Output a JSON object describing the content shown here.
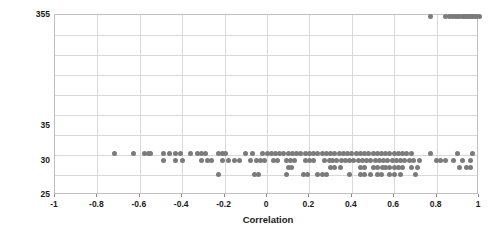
{
  "chart_data": {
    "type": "scatter",
    "title": "",
    "xlabel": "Correlation",
    "ylabel": "Number of elements",
    "xlim": [
      -1,
      1
    ],
    "xticks": [
      -1,
      -0.8,
      -0.6,
      -0.4,
      -0.2,
      0,
      0.2,
      0.4,
      0.6,
      0.8,
      1
    ],
    "xtick_labels": [
      "-1",
      "-0.8",
      "-0.6",
      "-0.4",
      "-0.2",
      "0",
      "0.2",
      "0.4",
      "0.6",
      "0.8",
      "1"
    ],
    "yticks": [
      25,
      30,
      35,
      355
    ],
    "ytick_labels": [
      "25",
      "30",
      "35",
      "355"
    ],
    "y_axis_note": "non-linear / broken axis: 25, 30, 35 then jump to 355",
    "grid": true,
    "grid_color": "#d9d9d9",
    "marker_color": "#7b7b7b",
    "marker_shape": "circle",
    "legend": false,
    "series": [
      {
        "name": "elements vs correlation",
        "points": [
          [
            -0.72,
            31
          ],
          [
            -0.63,
            31
          ],
          [
            -0.58,
            31
          ],
          [
            -0.56,
            31
          ],
          [
            -0.55,
            31
          ],
          [
            -0.49,
            31
          ],
          [
            -0.46,
            31
          ],
          [
            -0.43,
            31
          ],
          [
            -0.41,
            31
          ],
          [
            -0.36,
            31
          ],
          [
            -0.33,
            31
          ],
          [
            -0.31,
            31
          ],
          [
            -0.29,
            31
          ],
          [
            -0.23,
            31
          ],
          [
            -0.21,
            31
          ],
          [
            -0.195,
            31
          ],
          [
            -0.1,
            31
          ],
          [
            -0.07,
            31
          ],
          [
            -0.02,
            31
          ],
          [
            0.0,
            31
          ],
          [
            0.02,
            31
          ],
          [
            0.04,
            31
          ],
          [
            0.06,
            31
          ],
          [
            0.08,
            31
          ],
          [
            0.1,
            31
          ],
          [
            0.12,
            31
          ],
          [
            0.14,
            31
          ],
          [
            0.16,
            31
          ],
          [
            0.18,
            31
          ],
          [
            0.2,
            31
          ],
          [
            0.22,
            31
          ],
          [
            0.24,
            31
          ],
          [
            0.26,
            31
          ],
          [
            0.28,
            31
          ],
          [
            0.3,
            31
          ],
          [
            0.32,
            31
          ],
          [
            0.34,
            31
          ],
          [
            0.36,
            31
          ],
          [
            0.38,
            31
          ],
          [
            0.4,
            31
          ],
          [
            0.42,
            31
          ],
          [
            0.44,
            31
          ],
          [
            0.46,
            31
          ],
          [
            0.48,
            31
          ],
          [
            0.5,
            31
          ],
          [
            0.52,
            31
          ],
          [
            0.54,
            31
          ],
          [
            0.56,
            31
          ],
          [
            0.58,
            31
          ],
          [
            0.6,
            31
          ],
          [
            0.62,
            31
          ],
          [
            0.64,
            31
          ],
          [
            0.66,
            31
          ],
          [
            0.68,
            31
          ],
          [
            0.77,
            31
          ],
          [
            0.9,
            31
          ],
          [
            0.97,
            31
          ],
          [
            -0.49,
            30
          ],
          [
            -0.43,
            30
          ],
          [
            -0.4,
            30
          ],
          [
            -0.31,
            30
          ],
          [
            -0.28,
            30
          ],
          [
            -0.26,
            30
          ],
          [
            -0.21,
            30
          ],
          [
            -0.18,
            30
          ],
          [
            -0.155,
            30
          ],
          [
            -0.13,
            30
          ],
          [
            -0.08,
            30
          ],
          [
            -0.05,
            30
          ],
          [
            -0.03,
            30
          ],
          [
            -0.01,
            30
          ],
          [
            0.03,
            30
          ],
          [
            0.05,
            30
          ],
          [
            0.09,
            30
          ],
          [
            0.11,
            30
          ],
          [
            0.13,
            30
          ],
          [
            0.18,
            30
          ],
          [
            0.2,
            30
          ],
          [
            0.22,
            30
          ],
          [
            0.27,
            30
          ],
          [
            0.295,
            30
          ],
          [
            0.31,
            30
          ],
          [
            0.33,
            30
          ],
          [
            0.35,
            30
          ],
          [
            0.37,
            30
          ],
          [
            0.39,
            30
          ],
          [
            0.41,
            30
          ],
          [
            0.43,
            30
          ],
          [
            0.45,
            30
          ],
          [
            0.47,
            30
          ],
          [
            0.49,
            30
          ],
          [
            0.51,
            30
          ],
          [
            0.53,
            30
          ],
          [
            0.55,
            30
          ],
          [
            0.57,
            30
          ],
          [
            0.59,
            30
          ],
          [
            0.61,
            30
          ],
          [
            0.63,
            30
          ],
          [
            0.65,
            30
          ],
          [
            0.67,
            30
          ],
          [
            0.69,
            30
          ],
          [
            0.72,
            30
          ],
          [
            0.8,
            30
          ],
          [
            0.82,
            30
          ],
          [
            0.84,
            30
          ],
          [
            0.88,
            30
          ],
          [
            0.92,
            30
          ],
          [
            0.96,
            30
          ],
          [
            0.1,
            29
          ],
          [
            0.115,
            29
          ],
          [
            0.3,
            29
          ],
          [
            0.32,
            29
          ],
          [
            0.345,
            29
          ],
          [
            0.44,
            29
          ],
          [
            0.46,
            29
          ],
          [
            0.5,
            29
          ],
          [
            0.52,
            29
          ],
          [
            0.545,
            29
          ],
          [
            0.56,
            29
          ],
          [
            0.58,
            29
          ],
          [
            0.6,
            29
          ],
          [
            0.62,
            29
          ],
          [
            0.64,
            29
          ],
          [
            0.68,
            29
          ],
          [
            0.71,
            29
          ],
          [
            0.91,
            29
          ],
          [
            0.94,
            29
          ],
          [
            0.96,
            29
          ],
          [
            -0.23,
            28
          ],
          [
            -0.06,
            28
          ],
          [
            -0.04,
            28
          ],
          [
            0.09,
            28
          ],
          [
            0.17,
            28
          ],
          [
            0.19,
            28
          ],
          [
            0.24,
            28
          ],
          [
            0.26,
            28
          ],
          [
            0.28,
            28
          ],
          [
            0.39,
            28
          ],
          [
            0.44,
            28
          ],
          [
            0.46,
            28
          ],
          [
            0.49,
            28
          ],
          [
            0.52,
            28
          ],
          [
            0.54,
            28
          ],
          [
            0.58,
            28
          ],
          [
            0.6,
            28
          ],
          [
            0.63,
            28
          ],
          [
            0.7,
            28
          ],
          [
            0.77,
            352
          ],
          [
            0.84,
            352
          ],
          [
            0.86,
            352
          ],
          [
            0.875,
            352
          ],
          [
            0.89,
            352
          ],
          [
            0.9,
            352
          ],
          [
            0.91,
            352
          ],
          [
            0.92,
            352
          ],
          [
            0.93,
            352
          ],
          [
            0.94,
            352
          ],
          [
            0.95,
            352
          ],
          [
            0.96,
            352
          ],
          [
            0.97,
            352
          ],
          [
            0.98,
            352
          ],
          [
            0.99,
            352
          ],
          [
            1.0,
            352
          ]
        ]
      }
    ]
  }
}
